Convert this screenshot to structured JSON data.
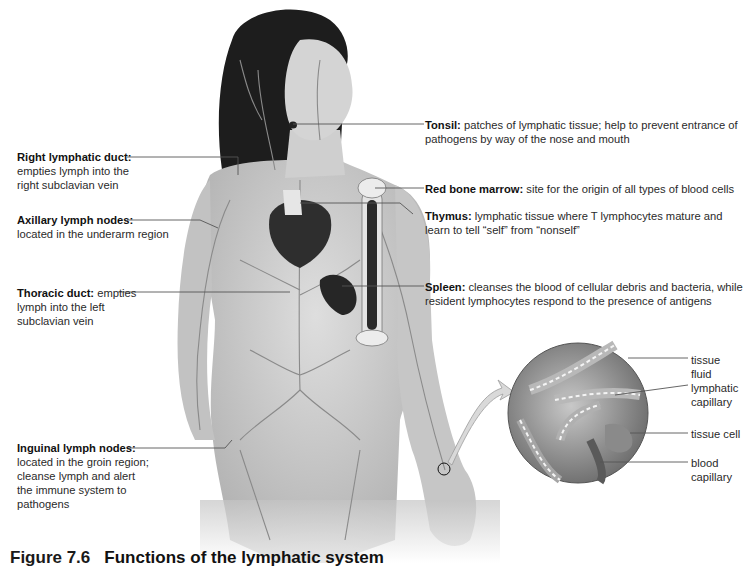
{
  "figure": {
    "number": "Figure 7.6",
    "caption": "Functions of the lymphatic system"
  },
  "left_labels": [
    {
      "title": "Right lymphatic duct:",
      "lines": [
        "empties lymph into the",
        "right subclavian vein"
      ]
    },
    {
      "title": "Axillary lymph nodes:",
      "lines": [
        "located in the underarm region"
      ]
    },
    {
      "title": "Thoracic duct:",
      "first_line_rest": " empties",
      "lines": [
        "lymph into the left",
        "subclavian vein"
      ]
    },
    {
      "title": "Inguinal lymph nodes:",
      "lines": [
        "located in the groin region;",
        "cleanse lymph and alert",
        "the immune system to",
        "pathogens"
      ]
    }
  ],
  "right_labels": [
    {
      "title": "Tonsil:",
      "first_line_rest": " patches of lymphatic tissue; help to prevent entrance of",
      "lines": [
        "pathogens by way of the nose and mouth"
      ]
    },
    {
      "title": "Red bone marrow:",
      "first_line_rest": " site for the origin of all types of blood cells",
      "lines": []
    },
    {
      "title": "Thymus:",
      "first_line_rest": " lymphatic tissue where T lymphocytes mature and",
      "lines": [
        "learn to tell “self” from “nonself”"
      ]
    },
    {
      "title": "Spleen:",
      "first_line_rest": " cleanses the blood of cellular debris and bacteria, while",
      "lines": [
        "resident lymphocytes respond to the presence of antigens"
      ]
    }
  ],
  "inset_labels": [
    {
      "lines": [
        "tissue",
        "fluid"
      ]
    },
    {
      "lines": [
        "lymphatic",
        "capillary"
      ]
    },
    {
      "lines": [
        "tissue cell"
      ]
    },
    {
      "lines": [
        "blood",
        "capillary"
      ]
    }
  ],
  "colors": {
    "skin": "#c9c9c9",
    "hair": "#1a1a1a",
    "vessels": "#8a8a8a",
    "organs": "#2b2b2b",
    "leader": "#555555"
  }
}
